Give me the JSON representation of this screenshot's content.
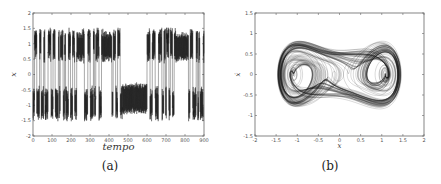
{
  "chart_data": [
    {
      "id": "a",
      "type": "line",
      "caption": "(a)",
      "title": "",
      "xlabel": "tempo",
      "ylabel": "x",
      "xlim": [
        0,
        900
      ],
      "ylim": [
        -2,
        2
      ],
      "xticks": [
        0,
        100,
        200,
        300,
        400,
        500,
        600,
        700,
        800,
        900
      ],
      "yticks": [
        -2,
        -1.5,
        -1,
        -0.5,
        0,
        0.5,
        1,
        1.5,
        2
      ],
      "grid": false,
      "legend": null,
      "description": "Chaotic time series x(tempo) switching between wells near +1 and -1, amplitude up to about ±1.5; interval ~470–600 confined to the negative well between about -1.3 and -0.25",
      "segments": [
        {
          "from": 0,
          "to": 230,
          "behavior": "rapid switching between wells, dense oscillation around +1 and -1"
        },
        {
          "from": 230,
          "to": 260,
          "behavior": "oscillation around +1 (0.5 to 1.5)"
        },
        {
          "from": 260,
          "to": 360,
          "behavior": "rapid switching"
        },
        {
          "from": 360,
          "to": 420,
          "behavior": "oscillation near +1 with switching"
        },
        {
          "from": 420,
          "to": 470,
          "behavior": "switching"
        },
        {
          "from": 470,
          "to": 600,
          "behavior": "trapped in negative well, -1.3 to -0.25"
        },
        {
          "from": 600,
          "to": 750,
          "behavior": "rapid switching"
        },
        {
          "from": 750,
          "to": 820,
          "behavior": "oscillation near +1 (0.4 to 1.3)"
        },
        {
          "from": 820,
          "to": 900,
          "behavior": "rapid switching"
        }
      ],
      "series": [
        {
          "name": "x",
          "color": "#1a1a1a"
        }
      ]
    },
    {
      "id": "b",
      "type": "line",
      "caption": "(b)",
      "title": "",
      "xlabel": "x",
      "ylabel": "ẋ",
      "xlim": [
        -2,
        2
      ],
      "ylim": [
        -1.5,
        1.5
      ],
      "xticks": [
        -2,
        -1.5,
        -1,
        -0.5,
        0,
        0.5,
        1,
        1.5,
        2
      ],
      "yticks": [
        -1.5,
        -1,
        -0.5,
        0,
        0.5,
        1,
        1.5
      ],
      "grid": false,
      "legend": null,
      "description": "Phase portrait (double-scroll / two-well attractor) with foci near x=-1 and x=+1, trajectories spanning x ∈ [-1.55, 1.55] and ẋ ∈ [-1.05, 1.05]",
      "attractor": {
        "centers": [
          [
            -1,
            0
          ],
          [
            1,
            0
          ]
        ],
        "x_extent": [
          -1.55,
          1.55
        ],
        "y_extent": [
          -1.05,
          1.05
        ]
      },
      "series": [
        {
          "name": "trajectory",
          "color": "#1a1a1a"
        }
      ]
    }
  ],
  "captions": {
    "a": "(a)",
    "b": "(b)"
  },
  "labels": {
    "a_x": "tempo",
    "a_y": "x",
    "b_x": "x",
    "b_y": "ẋ"
  }
}
